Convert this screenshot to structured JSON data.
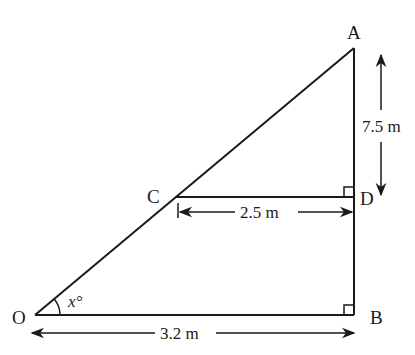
{
  "diagram": {
    "type": "right-triangle-geometry",
    "points": {
      "A": {
        "label": "A",
        "x": 354,
        "y": 48
      },
      "B": {
        "label": "B",
        "x": 354,
        "y": 315
      },
      "C": {
        "label": "C",
        "x": 176,
        "y": 197
      },
      "D": {
        "label": "D",
        "x": 354,
        "y": 197
      },
      "O": {
        "label": "O",
        "x": 35,
        "y": 315
      }
    },
    "measurements": {
      "AD": "7.5 m",
      "CD": "2.5 m",
      "OB": "3.2 m"
    },
    "angle": {
      "label": "x°",
      "vertex": "O"
    },
    "right_angles": [
      "D",
      "B"
    ],
    "colors": {
      "stroke": "#1a1a1a",
      "background": "#ffffff"
    }
  }
}
